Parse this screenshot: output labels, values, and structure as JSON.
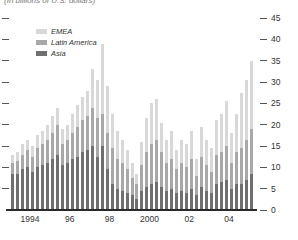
{
  "caption": "(In billions of U.S. dollars)",
  "colors": {
    "emea": "#d8d8d8",
    "latin_america": "#a8a8a8",
    "asia": "#6f6f6f",
    "axis": "#2a2a2a"
  },
  "legend": [
    {
      "label": "EMEA",
      "color": "#d8d8d8"
    },
    {
      "label": "Latin America",
      "color": "#a8a8a8"
    },
    {
      "label": "Asia",
      "color": "#6f6f6f"
    }
  ],
  "y_axis": {
    "ticks": [
      45,
      40,
      35,
      30,
      25,
      20,
      15,
      10,
      5,
      0
    ],
    "side": "right",
    "min": 0,
    "max": 45
  },
  "x_axis": {
    "labels": [
      "1994",
      "96",
      "98",
      "2000",
      "02",
      "04"
    ],
    "label_boundary_bar_index": [
      3,
      11,
      19,
      27,
      35,
      43
    ]
  },
  "chart_data": {
    "type": "bar",
    "stacked": true,
    "title": "(In billions of U.S. dollars)",
    "xlabel": "",
    "ylabel": "",
    "ylim": [
      0,
      45
    ],
    "grid": false,
    "legend_position": "top-left",
    "x": [
      "1994Q1",
      "1994Q2",
      "1994Q3",
      "1994Q4",
      "1995Q1",
      "1995Q2",
      "1995Q3",
      "1995Q4",
      "1996Q1",
      "1996Q2",
      "1996Q3",
      "1996Q4",
      "1997Q1",
      "1997Q2",
      "1997Q3",
      "1997Q4",
      "1998Q1",
      "1998Q2",
      "1998Q3",
      "1998Q4",
      "1999Q1",
      "1999Q2",
      "1999Q3",
      "1999Q4",
      "2000Q1",
      "2000Q2",
      "2000Q3",
      "2000Q4",
      "2001Q1",
      "2001Q2",
      "2001Q3",
      "2001Q4",
      "2002Q1",
      "2002Q2",
      "2002Q3",
      "2002Q4",
      "2003Q1",
      "2003Q2",
      "2003Q3",
      "2003Q4",
      "2004Q1",
      "2004Q2",
      "2004Q3",
      "2004Q4",
      "2005Q1",
      "2005Q2",
      "2005Q3",
      "2005Q4",
      "2006Q1"
    ],
    "series": [
      {
        "name": "Asia",
        "color": "#6f6f6f",
        "values": [
          8.5,
          8.5,
          9.5,
          10,
          9,
          10,
          10.5,
          11,
          12,
          13,
          10.5,
          11,
          12,
          12.5,
          13.5,
          14,
          15,
          12.5,
          15,
          9.5,
          6,
          5,
          4.5,
          4,
          3.5,
          2.5,
          4.5,
          5.5,
          6,
          6.5,
          5.5,
          4.5,
          5,
          4,
          4.5,
          4,
          5,
          3.5,
          5.5,
          4.5,
          4,
          6,
          6.5,
          7,
          5,
          6,
          6,
          7,
          8.5
        ]
      },
      {
        "name": "Latin America",
        "color": "#a8a8a8",
        "values": [
          2.5,
          3,
          3.5,
          4,
          3.5,
          4.5,
          5,
          5.5,
          6,
          7,
          5,
          5.5,
          6,
          7,
          7.5,
          8,
          9,
          9,
          7.5,
          8.5,
          8.5,
          7,
          6.5,
          5.5,
          4,
          3.5,
          6,
          8,
          9.5,
          10,
          8,
          6.5,
          7,
          5.5,
          6.5,
          6,
          7,
          4.5,
          7,
          6,
          5,
          7,
          7,
          8,
          6,
          7.5,
          8.5,
          9.5,
          10.5
        ]
      },
      {
        "name": "EMEA",
        "color": "#d8d8d8",
        "values": [
          2,
          2,
          2.5,
          2.5,
          2.5,
          3,
          3,
          3.5,
          4,
          4,
          3.5,
          3.5,
          4.5,
          5,
          5.5,
          6,
          9,
          9,
          16.5,
          11,
          8,
          6.5,
          5.5,
          4.5,
          3.5,
          2.5,
          5.5,
          8,
          9.5,
          9.5,
          7,
          5.5,
          6.5,
          4.5,
          5.5,
          5.5,
          6.5,
          4,
          7,
          6,
          5.5,
          8,
          9,
          10.5,
          7,
          9,
          13,
          14,
          16
        ]
      }
    ]
  }
}
